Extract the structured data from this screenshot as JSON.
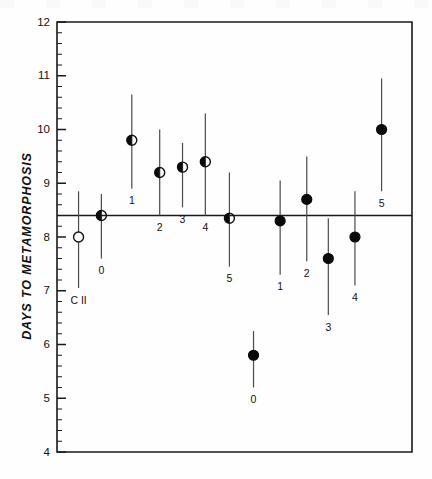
{
  "figure": {
    "kind": "scatter-with-error-bars",
    "background_color": "#fefefe",
    "ink_color": "#111111"
  },
  "axis": {
    "y_title": "DAYS  TO  METAMORPHOSIS",
    "y_ticks": [
      "12",
      "11",
      "10",
      "9",
      "8",
      "7",
      "6",
      "5",
      "4"
    ],
    "y_min": 4,
    "y_max": 12,
    "minor_ticks_per_major": 5,
    "x_ticks": [],
    "x_title": ""
  },
  "reference_line": {
    "value": 8.4,
    "color": "#1a1a1a"
  },
  "chart_data": {
    "type": "scatter",
    "title": "",
    "xlabel": "",
    "ylabel": "DAYS  TO  METAMORPHOSIS",
    "ylim": [
      4,
      12
    ],
    "xlim": [
      0,
      14
    ],
    "grid": false,
    "legend": "none",
    "reference_line_y": 8.4,
    "y_ticks": [
      4,
      5,
      6,
      7,
      8,
      9,
      10,
      11,
      12
    ],
    "series": [
      {
        "name": "control",
        "marker": "open-circle",
        "points": [
          {
            "label": "C II",
            "x": 0.85,
            "y": 8.0,
            "low": 7.05,
            "high": 8.85,
            "label_pos": "below"
          }
        ]
      },
      {
        "name": "half-filled-group",
        "marker": "half-filled-circle",
        "points": [
          {
            "label": "0",
            "x": 1.75,
            "y": 8.4,
            "low": 7.6,
            "high": 8.8,
            "label_pos": "below"
          },
          {
            "label": "1",
            "x": 2.95,
            "y": 9.8,
            "low": 8.9,
            "high": 10.65,
            "label_pos": "below"
          },
          {
            "label": "2",
            "x": 4.05,
            "y": 9.2,
            "low": 8.4,
            "high": 10.0,
            "label_pos": "below"
          },
          {
            "label": "3",
            "x": 4.95,
            "y": 9.3,
            "low": 8.55,
            "high": 9.75,
            "label_pos": "below"
          },
          {
            "label": "4",
            "x": 5.85,
            "y": 9.4,
            "low": 8.4,
            "high": 10.3,
            "label_pos": "below"
          },
          {
            "label": "5",
            "x": 6.8,
            "y": 8.35,
            "low": 7.45,
            "high": 9.2,
            "label_pos": "below"
          }
        ]
      },
      {
        "name": "solid-group",
        "marker": "solid-circle",
        "points": [
          {
            "label": "0",
            "x": 7.75,
            "y": 5.8,
            "low": 5.2,
            "high": 6.25,
            "label_pos": "below"
          },
          {
            "label": "1",
            "x": 8.8,
            "y": 8.3,
            "low": 7.3,
            "high": 9.05,
            "label_pos": "below"
          },
          {
            "label": "2",
            "x": 9.85,
            "y": 8.7,
            "low": 7.55,
            "high": 9.5,
            "label_pos": "below"
          },
          {
            "label": "3",
            "x": 10.7,
            "y": 7.6,
            "low": 6.55,
            "high": 8.35,
            "label_pos": "below"
          },
          {
            "label": "4",
            "x": 11.75,
            "y": 8.0,
            "low": 7.1,
            "high": 8.85,
            "label_pos": "below"
          },
          {
            "label": "5",
            "x": 12.8,
            "y": 10.0,
            "low": 8.85,
            "high": 10.95,
            "label_pos": "below"
          }
        ]
      }
    ]
  }
}
